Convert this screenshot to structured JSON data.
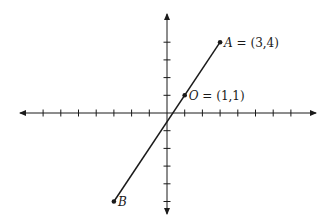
{
  "diagram": {
    "type": "coordinate-plane",
    "origin_px": [
      167,
      113
    ],
    "unit_px": 17.7,
    "x_ticks": [
      -7,
      -6,
      -5,
      -4,
      -3,
      -2,
      -1,
      1,
      2,
      3,
      4,
      5,
      6,
      7
    ],
    "y_ticks": [
      -5,
      -4,
      -3,
      -2,
      -1,
      1,
      2,
      3,
      4
    ],
    "line_color": "#1a1a1a",
    "points": [
      {
        "name": "A",
        "coords": [
          3,
          4
        ],
        "label_var": "A",
        "label_rest": " = (3,4)"
      },
      {
        "name": "O",
        "coords": [
          1,
          1
        ],
        "label_var": "O",
        "label_rest": " = (1,1)"
      },
      {
        "name": "B",
        "coords": [
          -3,
          -5
        ],
        "label_var": "B",
        "label_rest": ""
      }
    ],
    "segment": {
      "from": "B",
      "to": "A"
    }
  }
}
